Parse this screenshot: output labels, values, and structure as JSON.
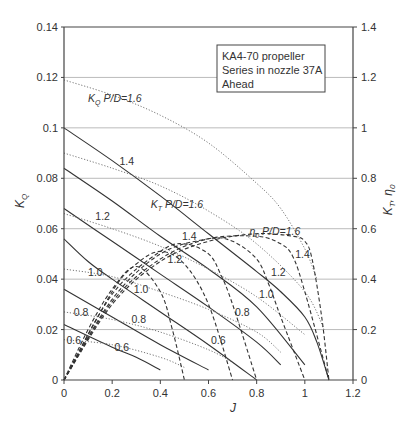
{
  "chart_data": {
    "type": "line",
    "title": "",
    "legend_box": [
      "KA4-70 propeller",
      "Series in nozzle 37A",
      "Ahead"
    ],
    "xlabel": "J",
    "ylabel_left": "K_Q",
    "ylabel_right": "K_T, η_0",
    "xlim": [
      0,
      1.2
    ],
    "ylim_left": [
      0,
      0.14
    ],
    "ylim_right": [
      0,
      1.4
    ],
    "x_ticks": [
      "0",
      "0.2",
      "0.4",
      "0.6",
      "0.8",
      "1",
      "1.2"
    ],
    "y_ticks_left": [
      "0",
      "0.02",
      "0.04",
      "0.06",
      "0.08",
      "0.1",
      "0.12",
      "0.14"
    ],
    "y_ticks_right": [
      "0",
      "0.2",
      "0.4",
      "0.6",
      "0.8",
      "1",
      "1.2",
      "1.4"
    ],
    "grid": "horizontal",
    "series": [
      {
        "name": "K_T P/D=1.6",
        "style": "solid",
        "axis": "right",
        "x": [
          0,
          0.2,
          0.4,
          0.6,
          0.8,
          0.9,
          1.0,
          1.05,
          1.1
        ],
        "y": [
          1.0,
          0.87,
          0.73,
          0.58,
          0.43,
          0.35,
          0.25,
          0.15,
          0.0
        ]
      },
      {
        "name": "K_T P/D=1.4",
        "style": "solid",
        "axis": "right",
        "x": [
          0,
          0.2,
          0.4,
          0.6,
          0.8,
          1.0
        ],
        "y": [
          0.84,
          0.71,
          0.57,
          0.44,
          0.29,
          0.06
        ]
      },
      {
        "name": "K_T P/D=1.2",
        "style": "solid",
        "axis": "right",
        "x": [
          0,
          0.2,
          0.4,
          0.6,
          0.8,
          0.9
        ],
        "y": [
          0.68,
          0.55,
          0.42,
          0.29,
          0.15,
          0.06
        ]
      },
      {
        "name": "K_T P/D=1.0",
        "style": "solid",
        "axis": "right",
        "x": [
          0,
          0.1,
          0.2,
          0.4,
          0.6,
          0.8
        ],
        "y": [
          0.56,
          0.47,
          0.4,
          0.27,
          0.14,
          0.0
        ]
      },
      {
        "name": "K_T P/D=0.8",
        "style": "solid",
        "axis": "right",
        "x": [
          0,
          0.2,
          0.4,
          0.6
        ],
        "y": [
          0.36,
          0.25,
          0.14,
          0.04
        ]
      },
      {
        "name": "K_T P/D=0.6",
        "style": "solid",
        "axis": "right",
        "x": [
          0,
          0.2,
          0.3,
          0.4
        ],
        "y": [
          0.22,
          0.13,
          0.09,
          0.04
        ]
      },
      {
        "name": "K_Q P/D=1.6",
        "style": "dotted",
        "axis": "left",
        "x": [
          0,
          0.2,
          0.4,
          0.6,
          0.8,
          0.9,
          1.0,
          1.05
        ],
        "y": [
          0.119,
          0.113,
          0.105,
          0.094,
          0.078,
          0.068,
          0.052,
          0.04
        ]
      },
      {
        "name": "K_Q P/D=1.4",
        "style": "dotted",
        "axis": "left",
        "x": [
          0,
          0.2,
          0.4,
          0.6,
          0.8,
          1.0,
          1.08
        ],
        "y": [
          0.09,
          0.084,
          0.077,
          0.067,
          0.054,
          0.035,
          0.02
        ]
      },
      {
        "name": "K_Q P/D=1.2",
        "style": "dotted",
        "axis": "left",
        "x": [
          0,
          0.2,
          0.4,
          0.6,
          0.8,
          1.0
        ],
        "y": [
          0.066,
          0.06,
          0.053,
          0.044,
          0.033,
          0.018
        ]
      },
      {
        "name": "K_Q P/D=1.0",
        "style": "dotted",
        "axis": "left",
        "x": [
          0,
          0.2,
          0.4,
          0.6,
          0.8,
          0.9
        ],
        "y": [
          0.044,
          0.041,
          0.035,
          0.028,
          0.019,
          0.011
        ]
      },
      {
        "name": "K_Q P/D=0.8",
        "style": "dotted",
        "axis": "left",
        "x": [
          0,
          0.2,
          0.4,
          0.6,
          0.7
        ],
        "y": [
          0.027,
          0.024,
          0.019,
          0.012,
          0.007
        ]
      },
      {
        "name": "K_Q P/D=0.6",
        "style": "dotted",
        "axis": "left",
        "x": [
          0,
          0.2,
          0.4,
          0.5
        ],
        "y": [
          0.016,
          0.014,
          0.009,
          0.005
        ]
      },
      {
        "name": "η0 P/D=1.6",
        "style": "dashed",
        "axis": "right",
        "x": [
          0,
          0.2,
          0.4,
          0.6,
          0.8,
          0.95,
          1.0,
          1.03,
          1.07,
          1.1
        ],
        "y": [
          0,
          0.3,
          0.47,
          0.55,
          0.58,
          0.57,
          0.55,
          0.48,
          0.25,
          0.0
        ]
      },
      {
        "name": "η0 P/D=1.4",
        "style": "dashed",
        "axis": "right",
        "x": [
          0,
          0.2,
          0.4,
          0.6,
          0.8,
          0.9,
          0.95,
          1.0,
          1.1
        ],
        "y": [
          0,
          0.31,
          0.48,
          0.56,
          0.57,
          0.54,
          0.49,
          0.35,
          0.0
        ]
      },
      {
        "name": "η0 P/D=1.2",
        "style": "dashed",
        "axis": "right",
        "x": [
          0,
          0.2,
          0.4,
          0.6,
          0.7,
          0.8,
          0.85,
          0.9,
          1.0
        ],
        "y": [
          0,
          0.32,
          0.5,
          0.56,
          0.55,
          0.48,
          0.38,
          0.25,
          0.0
        ]
      },
      {
        "name": "η0 P/D=1.0",
        "style": "dashed",
        "axis": "right",
        "x": [
          0,
          0.2,
          0.4,
          0.5,
          0.6,
          0.65,
          0.7,
          0.8
        ],
        "y": [
          0,
          0.34,
          0.51,
          0.54,
          0.5,
          0.42,
          0.3,
          0.0
        ]
      },
      {
        "name": "η0 P/D=0.8",
        "style": "dashed",
        "axis": "right",
        "x": [
          0,
          0.2,
          0.3,
          0.4,
          0.5,
          0.6,
          0.7
        ],
        "y": [
          0,
          0.35,
          0.46,
          0.51,
          0.46,
          0.3,
          0.0
        ]
      },
      {
        "name": "η0 P/D=0.6",
        "style": "dashed",
        "axis": "right",
        "x": [
          0,
          0.1,
          0.2,
          0.3,
          0.4,
          0.45,
          0.5
        ],
        "y": [
          0,
          0.2,
          0.36,
          0.45,
          0.35,
          0.2,
          0.0
        ]
      }
    ],
    "annotations": [
      {
        "text": "K_Q P/D=1.6",
        "x": 0.1,
        "y_left": 0.112
      },
      {
        "text": "1.4",
        "x": 0.23,
        "y_left": 0.087
      },
      {
        "text": "K_T P/D=1.6",
        "x": 0.36,
        "y_left": 0.07
      },
      {
        "text": "1.2",
        "x": 0.13,
        "y_left": 0.065
      },
      {
        "text": "1.4",
        "x": 0.49,
        "y_left": 0.057
      },
      {
        "text": "1.2",
        "x": 0.43,
        "y_left": 0.048
      },
      {
        "text": "1.0",
        "x": 0.1,
        "y_left": 0.043
      },
      {
        "text": "1.0",
        "x": 0.29,
        "y_left": 0.036
      },
      {
        "text": "0.8",
        "x": 0.04,
        "y_left": 0.027
      },
      {
        "text": "0.8",
        "x": 0.28,
        "y_left": 0.024
      },
      {
        "text": "0.6",
        "x": 0.01,
        "y_left": 0.016
      },
      {
        "text": "0.6",
        "x": 0.21,
        "y_left": 0.013
      },
      {
        "text": "0.6",
        "x": 0.61,
        "y_left": 0.016
      },
      {
        "text": "η0 P/D=1.6",
        "x": 0.77,
        "y_left": 0.059
      },
      {
        "text": "1.4",
        "x": 0.96,
        "y_left": 0.05
      },
      {
        "text": "1.2",
        "x": 0.86,
        "y_left": 0.043
      },
      {
        "text": "1.0",
        "x": 0.81,
        "y_left": 0.034
      },
      {
        "text": "0.8",
        "x": 0.71,
        "y_left": 0.027
      }
    ]
  }
}
